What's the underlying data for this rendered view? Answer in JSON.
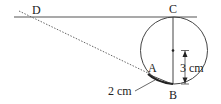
{
  "diagram": {
    "points": {
      "D": "D",
      "C": "C",
      "A": "A",
      "B": "B"
    },
    "measurements": {
      "arc_AB": "2 cm",
      "radius": "3 cm"
    },
    "colors": {
      "line": "#555555",
      "dotted": "#666666",
      "text": "#222222"
    }
  }
}
